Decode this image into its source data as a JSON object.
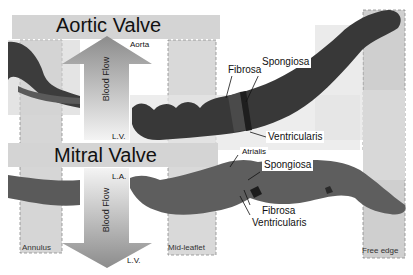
{
  "figure": {
    "aortic_valve": {
      "title": "Aortic Valve",
      "top_label": "Aorta",
      "bottom_label": "L.V.",
      "arrow_label": "Blood Flow",
      "layers": [
        "Fibrosa",
        "Spongiosa",
        "Ventricularis"
      ]
    },
    "mitral_valve": {
      "title": "Mitral Valve",
      "top_label": "L.A.",
      "bottom_label": "L.V.",
      "arrow_label": "Blood Flow",
      "layers": [
        "Atrialis",
        "Spongiosa",
        "Fibrosa",
        "Ventricularis"
      ]
    },
    "regions": [
      "Annulus",
      "Mid-leaflet",
      "Free edge"
    ],
    "colors": {
      "banner": "#d4d4d4",
      "region_box": "#cfcfcf",
      "tissue": "#3a3a3a",
      "arrow_top": "#8a8a8a",
      "arrow_bottom": "#f2f2f2",
      "dashed_border": "#888888"
    }
  }
}
